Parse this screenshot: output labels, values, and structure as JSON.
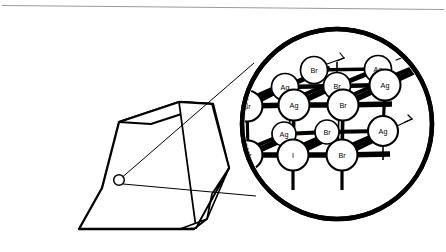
{
  "figure": {
    "colors": {
      "ink": "#000000",
      "background": "#ffffff",
      "rule": "#9a9a9a",
      "faint_text": "#c9c9c9"
    }
  },
  "top_rule": {
    "name": "page-rule",
    "visible": true
  },
  "crystal": {
    "name": "hexagonal-crystal",
    "shape": "hexagonal-prism",
    "marker": {
      "name": "lattice-site-marker",
      "label": ""
    }
  },
  "callout": {
    "name": "magnifier-callout",
    "upper_line": "",
    "lower_line": ""
  },
  "magnifier": {
    "name": "magnified-lattice-circle",
    "center": {
      "x": 337,
      "y": 124
    },
    "radius": 95
  },
  "lattice": {
    "name": "crystal-lattice",
    "element_symbols": [
      "Ag",
      "Br",
      "I"
    ],
    "atoms": [
      {
        "id": "a01",
        "label": "Br",
        "x": 314,
        "y": 70,
        "r": 13.5,
        "layer": "back"
      },
      {
        "id": "a02",
        "label": "Ag",
        "x": 378,
        "y": 69,
        "r": 13.5,
        "layer": "back"
      },
      {
        "id": "a03",
        "label": "Ag",
        "x": 285,
        "y": 87,
        "r": 13.5,
        "layer": "back"
      },
      {
        "id": "a04",
        "label": "Br",
        "x": 337,
        "y": 86,
        "r": 13.5,
        "layer": "back"
      },
      {
        "id": "a05",
        "label": "Ag",
        "x": 385,
        "y": 85,
        "r": 15.5,
        "layer": "mid"
      },
      {
        "id": "a06",
        "label": "Br",
        "x": 247,
        "y": 106,
        "r": 15.5,
        "layer": "front"
      },
      {
        "id": "a07",
        "label": "Ag",
        "x": 294,
        "y": 105,
        "r": 15.5,
        "layer": "front"
      },
      {
        "id": "a08",
        "label": "Br",
        "x": 343,
        "y": 105,
        "r": 15.5,
        "layer": "front"
      },
      {
        "id": "a09",
        "label": "Ag",
        "x": 284,
        "y": 134,
        "r": 12.0,
        "layer": "back"
      },
      {
        "id": "a10",
        "label": "Br",
        "x": 327,
        "y": 132,
        "r": 12.0,
        "layer": "back"
      },
      {
        "id": "a11",
        "label": "Ag",
        "x": 383,
        "y": 131,
        "r": 15.0,
        "layer": "mid"
      },
      {
        "id": "a12",
        "label": "Br",
        "x": 248,
        "y": 155,
        "r": 14.5,
        "layer": "front"
      },
      {
        "id": "a13",
        "label": "I",
        "x": 293,
        "y": 155,
        "r": 15.5,
        "layer": "front"
      },
      {
        "id": "a14",
        "label": "Br",
        "x": 342,
        "y": 155,
        "r": 15.5,
        "layer": "front"
      }
    ]
  },
  "caption": {
    "fragment": ""
  }
}
